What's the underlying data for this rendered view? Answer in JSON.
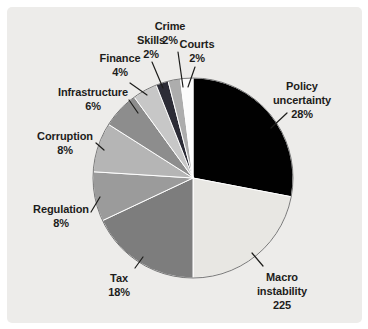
{
  "figure": {
    "kind": "pie-chart-figure",
    "background_color": "#edecea",
    "page_margin_color": "#ffffff",
    "text_color": "#1d1d1b",
    "leader_line_color": "#1d1d1b",
    "slice_separator_color": "#ffffff",
    "rim_color": "#3f3f3f"
  },
  "chart_data": {
    "type": "pie",
    "title": "",
    "start_angle_deg": 0,
    "direction": "clockwise",
    "legend": "none (labels with leader lines around pie)",
    "slices": [
      {
        "id": "policy",
        "label": "Policy uncertainty",
        "label_lines": [
          "Policy",
          "uncertainty"
        ],
        "value": 28,
        "value_label": "28%",
        "color": "#010101"
      },
      {
        "id": "macro",
        "label": "Macro instability",
        "label_lines": [
          "Macro",
          "instability"
        ],
        "value": 22,
        "value_label": "225",
        "color": "#e8e7e3"
      },
      {
        "id": "tax",
        "label": "Tax",
        "label_lines": [
          "Tax"
        ],
        "value": 18,
        "value_label": "18%",
        "color": "#7d7d7d"
      },
      {
        "id": "regulation",
        "label": "Regulation",
        "label_lines": [
          "Regulation"
        ],
        "value": 8,
        "value_label": "8%",
        "color": "#9b9b9b"
      },
      {
        "id": "corruption",
        "label": "Corruption",
        "label_lines": [
          "Corruption"
        ],
        "value": 8,
        "value_label": "8%",
        "color": "#b5b5b5"
      },
      {
        "id": "infrastructure",
        "label": "Infrastructure",
        "label_lines": [
          "Infrastructure"
        ],
        "value": 6,
        "value_label": "6%",
        "color": "#8d8d8d"
      },
      {
        "id": "finance",
        "label": "Finance",
        "label_lines": [
          "Finance"
        ],
        "value": 4,
        "value_label": "4%",
        "color": "#c7c7c7"
      },
      {
        "id": "skills",
        "label": "Skills",
        "label_lines": [
          "Skills"
        ],
        "value": 2,
        "value_label": "2%",
        "color": "#2c2c36"
      },
      {
        "id": "crime",
        "label": "Crime",
        "label_lines": [
          "Crime"
        ],
        "value": 2,
        "value_label": "2%",
        "color": "#adadad"
      },
      {
        "id": "courts",
        "label": "Courts",
        "label_lines": [
          "Courts"
        ],
        "value": 2,
        "value_label": "2%",
        "color": "#fcfcfc"
      }
    ]
  }
}
